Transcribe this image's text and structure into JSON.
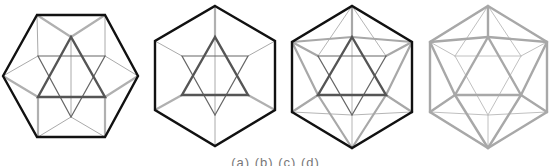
{
  "figure": {
    "colors": {
      "black": "#111111",
      "dark_gray": "#555555",
      "mid_gray": "#9a9a9a",
      "light_gray": "#b5b5b5"
    },
    "panels": [
      {
        "id": "panel-1",
        "label": "cuboctahedral projection with star of David"
      },
      {
        "id": "panel-2",
        "label": "hexagon with star of David"
      },
      {
        "id": "panel-3",
        "label": "hexagon with star and icosahedral edges"
      },
      {
        "id": "panel-4",
        "label": "gray icosahedron"
      }
    ]
  },
  "caption": "(a) (b) (c) (d)"
}
